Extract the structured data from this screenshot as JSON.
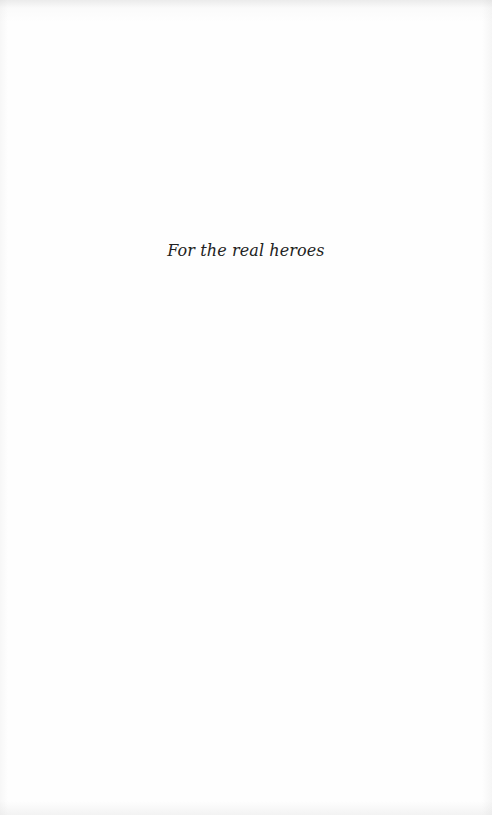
{
  "page": {
    "type": "dedication",
    "dedication_text": "For the real heroes"
  },
  "colors": {
    "background": "#fefefe",
    "text": "#222222"
  }
}
